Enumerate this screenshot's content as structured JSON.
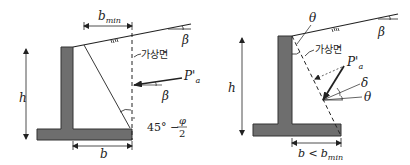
{
  "left_diagram": {
    "labels": {
      "b_min_main": "b",
      "b_min_sub": "min",
      "imaginary_plane": "가상면",
      "beta_slope": "β",
      "P_a": "P'",
      "P_a_sub": "a",
      "beta_force": "β",
      "height": "h",
      "angle_prefix": "45° −",
      "angle_num": "φ",
      "angle_den": "2",
      "base_width": "b"
    }
  },
  "right_diagram": {
    "labels": {
      "theta_top": "θ",
      "beta_slope": "β",
      "imaginary_plane": "가상면",
      "P_a": "P'",
      "P_a_sub": "a",
      "delta": "δ",
      "theta_force": "θ",
      "height": "h",
      "base_width_main": "b <",
      "base_width_b": "b",
      "base_width_sub": "min"
    }
  },
  "colors": {
    "wall_fill": "#6e6e6e",
    "wall_stroke": "#333333",
    "line": "#222222"
  }
}
